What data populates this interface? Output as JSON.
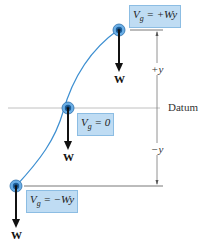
{
  "diagram": {
    "positions": [
      {
        "id": "top",
        "equation": "V_g = +Wy",
        "eq_main": "V",
        "eq_sub": "g",
        "eq_rest": " = +Wy",
        "weight_label": "W"
      },
      {
        "id": "middle",
        "equation": "V_g = 0",
        "eq_main": "V",
        "eq_sub": "g",
        "eq_rest": " = 0",
        "weight_label": "W"
      },
      {
        "id": "bottom",
        "equation": "V_g = -Wy",
        "eq_main": "V",
        "eq_sub": "g",
        "eq_rest": " = −Wy",
        "weight_label": "W"
      }
    ],
    "datum_label": "Datum",
    "plus_y_label": "+y",
    "minus_y_label": "−y",
    "colors": {
      "path": "#3d8fd1",
      "box_fill": "#bfdcf3",
      "box_border": "#8cbde3",
      "datum_line": "#bbbbbb",
      "arrow": "#111111"
    }
  }
}
